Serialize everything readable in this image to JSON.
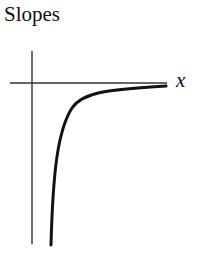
{
  "title": "Slopes",
  "axis": {
    "x_label": "x"
  },
  "curve": {
    "description": "increasing concave-down curve approaching horizontal axis from below",
    "color": "#111111"
  }
}
